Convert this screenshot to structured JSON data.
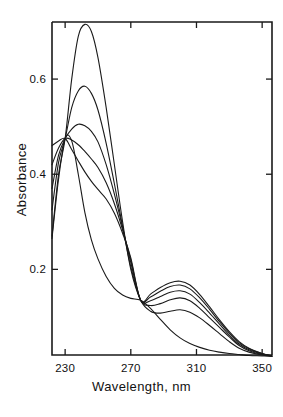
{
  "chart_data": {
    "type": "line",
    "title": "",
    "subtitle": "",
    "xlabel": "Wavelength, nm",
    "ylabel": "Absorbance",
    "xlim": [
      222,
      356
    ],
    "ylim": [
      0.02,
      0.72
    ],
    "grid": false,
    "legend": "none",
    "xticks": [
      230,
      270,
      310,
      350
    ],
    "xtick_labels": [
      "230",
      "270",
      "310",
      "350"
    ],
    "yticks": [
      0.2,
      0.4,
      0.6
    ],
    "ytick_labels": [
      "0.2",
      "0.4",
      "0.6"
    ],
    "annotations": [
      {
        "label": "isosbestic point 1",
        "x": 230,
        "y": 0.475
      },
      {
        "label": "isosbestic point 2",
        "x": 276,
        "y": 0.135
      }
    ],
    "x": [
      222,
      226,
      230,
      234,
      238,
      242,
      246,
      250,
      255,
      260,
      265,
      270,
      276,
      282,
      288,
      294,
      300,
      306,
      312,
      318,
      324,
      330,
      336,
      342,
      350,
      356
    ],
    "series": [
      {
        "name": "curve-1",
        "values": [
          0.27,
          0.4,
          0.475,
          0.6,
          0.69,
          0.715,
          0.7,
          0.645,
          0.54,
          0.42,
          0.3,
          0.2,
          0.135,
          0.112,
          0.108,
          0.112,
          0.115,
          0.11,
          0.098,
          0.082,
          0.065,
          0.048,
          0.034,
          0.026,
          0.02,
          0.018
        ]
      },
      {
        "name": "curve-2",
        "values": [
          0.325,
          0.425,
          0.475,
          0.54,
          0.575,
          0.585,
          0.57,
          0.535,
          0.465,
          0.38,
          0.29,
          0.205,
          0.135,
          0.124,
          0.128,
          0.136,
          0.14,
          0.134,
          0.118,
          0.098,
          0.078,
          0.058,
          0.04,
          0.029,
          0.021,
          0.018
        ]
      },
      {
        "name": "curve-3",
        "values": [
          0.37,
          0.44,
          0.475,
          0.495,
          0.505,
          0.502,
          0.49,
          0.468,
          0.42,
          0.358,
          0.288,
          0.214,
          0.135,
          0.134,
          0.143,
          0.152,
          0.155,
          0.148,
          0.13,
          0.108,
          0.085,
          0.062,
          0.043,
          0.031,
          0.022,
          0.018
        ]
      },
      {
        "name": "curve-4",
        "values": [
          0.42,
          0.455,
          0.475,
          0.472,
          0.462,
          0.448,
          0.432,
          0.414,
          0.382,
          0.338,
          0.283,
          0.22,
          0.135,
          0.142,
          0.154,
          0.164,
          0.167,
          0.159,
          0.14,
          0.116,
          0.09,
          0.066,
          0.046,
          0.033,
          0.023,
          0.018
        ]
      },
      {
        "name": "curve-5",
        "values": [
          0.46,
          0.47,
          0.475,
          0.452,
          0.428,
          0.405,
          0.385,
          0.368,
          0.348,
          0.318,
          0.276,
          0.224,
          0.135,
          0.148,
          0.162,
          0.172,
          0.175,
          0.167,
          0.147,
          0.121,
          0.094,
          0.069,
          0.048,
          0.034,
          0.023,
          0.018
        ]
      },
      {
        "name": "curve-6",
        "values": [
          0.265,
          0.39,
          0.475,
          0.47,
          0.4,
          0.32,
          0.262,
          0.222,
          0.185,
          0.16,
          0.146,
          0.139,
          0.135,
          0.118,
          0.095,
          0.073,
          0.056,
          0.044,
          0.036,
          0.03,
          0.026,
          0.023,
          0.021,
          0.019,
          0.018,
          0.017
        ]
      }
    ],
    "style": {
      "line_color": "#1a1a1a",
      "line_width": 1.1,
      "frame_color": "#1a1a1a",
      "background": "#ffffff"
    }
  }
}
